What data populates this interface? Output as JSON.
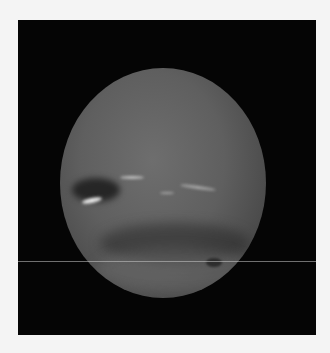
{
  "image": {
    "subject": "Neptune",
    "description": "Grayscale image of the planet Neptune on a black background, showing a large dark spot with bright white clouds on the left, faint cloud streaks, and dark/light latitudinal bands in the southern hemisphere with a small dark spot.",
    "colors": {
      "background": "#f4f4f4",
      "space": "#050505",
      "planet": "#606060",
      "clouds": "#e9e9e9"
    }
  }
}
